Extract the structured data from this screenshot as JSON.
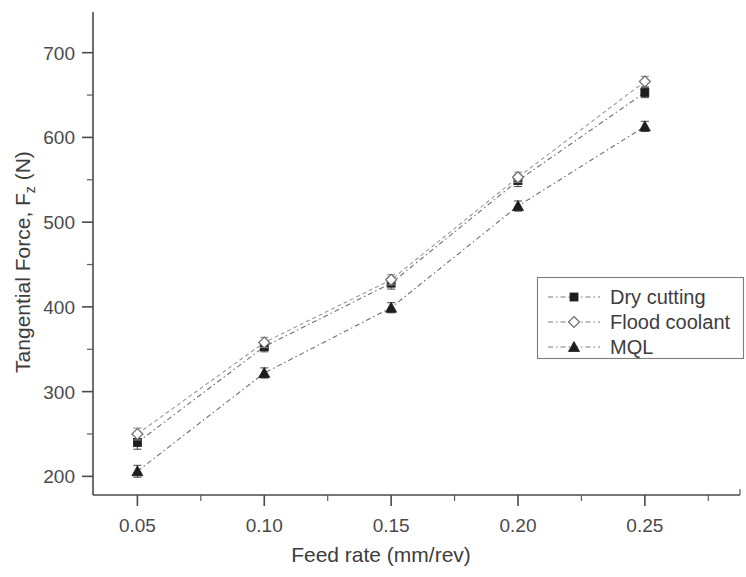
{
  "chart_data": {
    "type": "line",
    "title": "",
    "xlabel": "Feed rate (mm/rev)",
    "ylabel": "Tangential Force, F",
    "ylabel_sub": "z",
    "ylabel_unit": " (N)",
    "x": [
      0.05,
      0.1,
      0.15,
      0.2,
      0.25
    ],
    "xtick_labels": [
      "0.05",
      "0.10",
      "0.15",
      "0.20",
      "0.25"
    ],
    "ytick_labels": [
      "200",
      "300",
      "400",
      "500",
      "600",
      "700"
    ],
    "ytick_values": [
      200,
      300,
      400,
      500,
      600,
      700
    ],
    "yminor_values": [
      250,
      350,
      450,
      550,
      650
    ],
    "xminor_values": [
      0.075,
      0.125,
      0.175,
      0.225,
      0.275
    ],
    "xlim": [
      0.0325,
      0.2875
    ],
    "ylim": [
      178,
      748
    ],
    "grid": false,
    "legend_position": "center-right",
    "series": [
      {
        "name": "Dry cutting",
        "marker": "filled-square",
        "values": [
          240,
          353,
          428,
          549,
          653
        ],
        "errors": [
          8,
          6,
          7,
          7,
          6
        ]
      },
      {
        "name": "Flood coolant",
        "marker": "open-diamond",
        "values": [
          250,
          358,
          432,
          553,
          666
        ],
        "errors": [
          7,
          6,
          6,
          6,
          6
        ]
      },
      {
        "name": "MQL",
        "marker": "filled-triangle",
        "values": [
          206,
          322,
          399,
          519,
          613
        ],
        "errors": [
          7,
          6,
          6,
          6,
          6
        ]
      }
    ]
  },
  "colors": {
    "axis": "#4a4a4a",
    "series_dry": "#1d1d1d",
    "series_flood": "#6d6d6d",
    "series_mql": "#1d1d1d",
    "background": "#ffffff"
  }
}
